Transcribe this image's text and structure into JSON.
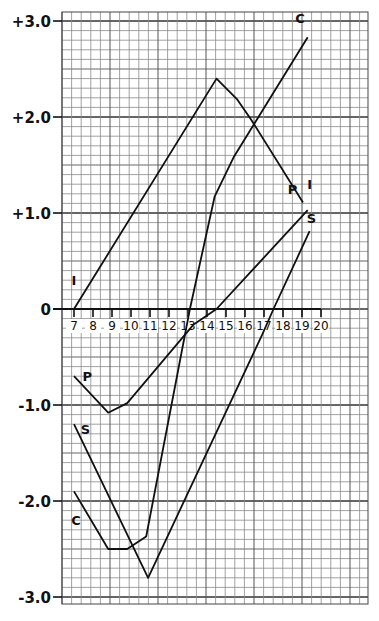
{
  "chart_data": {
    "type": "line",
    "title": "",
    "xlabel": "",
    "ylabel": "",
    "xlim": [
      7,
      20
    ],
    "ylim": [
      -3.0,
      3.0
    ],
    "grid": true,
    "grid_minor_step_y": 0.1,
    "x_ticks": [
      7,
      8,
      9,
      10,
      11,
      12,
      13,
      14,
      15,
      16,
      17,
      18,
      19,
      20
    ],
    "x_tick_labels": [
      "7",
      "8",
      "9",
      "10",
      "11",
      "12",
      "13",
      "14",
      "15",
      "16",
      "17",
      "18",
      "19",
      "20"
    ],
    "y_ticks": [
      3.0,
      2.0,
      1.0,
      0,
      -1.0,
      -2.0,
      -3.0
    ],
    "y_tick_labels": [
      "+3.0",
      "+2.0",
      "+1.0",
      "0",
      "-1.0",
      "-2.0",
      "-3.0"
    ],
    "legend": "inline labels (I, C, P, S)",
    "series": [
      {
        "name": "I",
        "label_positions": [
          {
            "x": 7.0,
            "y": 0.25
          },
          {
            "x": 19.4,
            "y": 1.25
          }
        ],
        "points": [
          [
            7.0,
            0.0
          ],
          [
            14.5,
            2.4
          ],
          [
            15.6,
            2.18
          ],
          [
            16.3,
            1.98
          ],
          [
            19.05,
            1.11
          ]
        ]
      },
      {
        "name": "C",
        "label_positions": [
          {
            "x": 7.1,
            "y": -2.25
          },
          {
            "x": 18.9,
            "y": 2.98
          }
        ],
        "points": [
          [
            7.0,
            -1.9
          ],
          [
            8.8,
            -2.5
          ],
          [
            9.8,
            -2.5
          ],
          [
            10.8,
            -2.37
          ],
          [
            13.1,
            0.0
          ],
          [
            14.4,
            1.17
          ],
          [
            15.4,
            1.58
          ],
          [
            19.3,
            2.83
          ]
        ]
      },
      {
        "name": "P",
        "label_positions": [
          {
            "x": 7.7,
            "y": -0.75
          },
          {
            "x": 18.5,
            "y": 1.2
          }
        ],
        "points": [
          [
            7.0,
            -0.7
          ],
          [
            8.8,
            -1.08
          ],
          [
            9.8,
            -0.98
          ],
          [
            13.3,
            -0.16
          ],
          [
            14.5,
            0.0
          ],
          [
            19.3,
            1.03
          ]
        ]
      },
      {
        "name": "S",
        "label_positions": [
          {
            "x": 7.6,
            "y": -1.3
          },
          {
            "x": 19.5,
            "y": 0.9
          }
        ],
        "points": [
          [
            7.0,
            -1.2
          ],
          [
            10.9,
            -2.8
          ],
          [
            16.9,
            -0.27
          ],
          [
            17.5,
            0.0
          ],
          [
            19.4,
            0.81
          ]
        ]
      }
    ]
  }
}
